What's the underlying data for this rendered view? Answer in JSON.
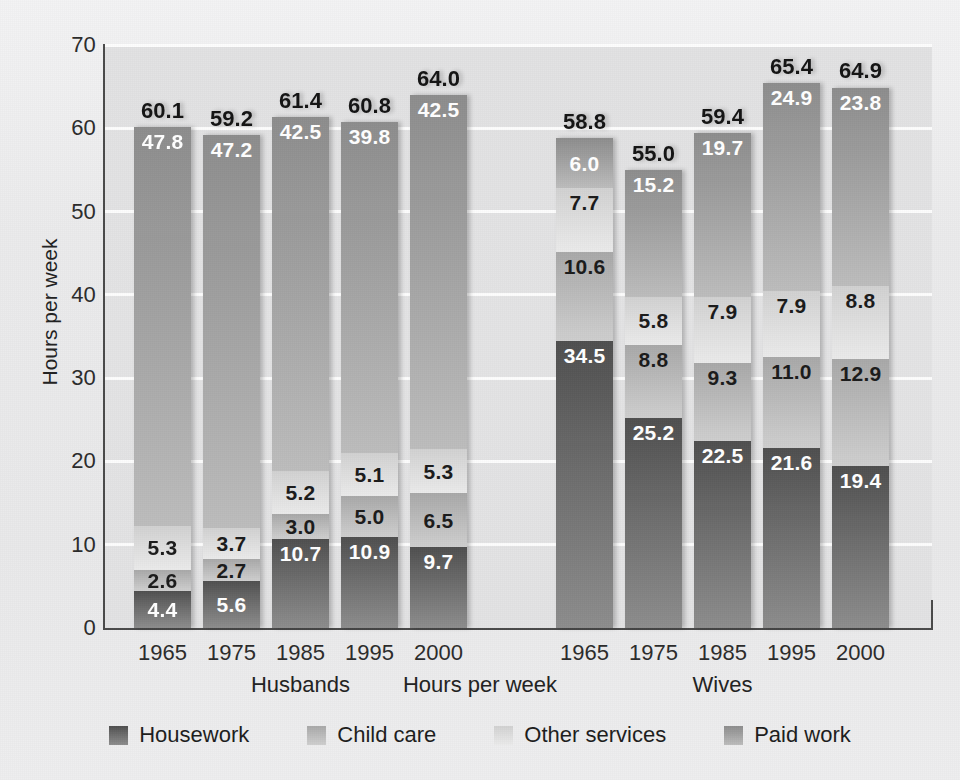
{
  "chart_data": {
    "type": "bar",
    "subtype": "stacked-bar-grouped",
    "title": "",
    "xlabel": "Hours per week",
    "ylabel": "Hours per week",
    "ylim": [
      0,
      70
    ],
    "yticks": [
      0,
      10,
      20,
      30,
      40,
      50,
      60,
      70
    ],
    "ytick_labels": [
      "0",
      "10",
      "20",
      "30",
      "40",
      "50",
      "60",
      "70"
    ],
    "grid": true,
    "legend_position": "bottom",
    "stack_order_bottom_to_top": [
      "Housework",
      "Child care",
      "Other services",
      "Paid work"
    ],
    "categories": [
      "1965",
      "1975",
      "1985",
      "1995",
      "2000"
    ],
    "groups": [
      {
        "name": "Husbands",
        "categories": [
          "1965",
          "1975",
          "1985",
          "1995",
          "2000"
        ],
        "series": [
          {
            "name": "Housework",
            "values": [
              4.4,
              5.6,
              10.7,
              10.9,
              9.7
            ]
          },
          {
            "name": "Child care",
            "values": [
              2.6,
              2.7,
              3.0,
              5.0,
              6.5
            ]
          },
          {
            "name": "Other services",
            "values": [
              5.3,
              3.7,
              5.2,
              5.1,
              5.3
            ]
          },
          {
            "name": "Paid work",
            "values": [
              47.8,
              47.2,
              42.5,
              39.8,
              42.5
            ]
          }
        ],
        "totals": [
          60.1,
          59.2,
          61.4,
          60.8,
          64.0
        ]
      },
      {
        "name": "Wives",
        "categories": [
          "1965",
          "1975",
          "1985",
          "1995",
          "2000"
        ],
        "series": [
          {
            "name": "Housework",
            "values": [
              34.5,
              25.2,
              22.5,
              21.6,
              19.4
            ]
          },
          {
            "name": "Child care",
            "values": [
              10.6,
              8.8,
              9.3,
              11.0,
              12.9
            ]
          },
          {
            "name": "Other services",
            "values": [
              7.7,
              5.8,
              7.9,
              7.9,
              8.8
            ]
          },
          {
            "name": "Paid work",
            "values": [
              6.0,
              15.2,
              19.7,
              24.9,
              23.8
            ]
          }
        ],
        "totals": [
          58.8,
          55.0,
          59.4,
          65.4,
          64.9
        ]
      }
    ],
    "legend": [
      {
        "label": "Housework",
        "color": "#6d6d6d"
      },
      {
        "label": "Child care",
        "color": "#bcbcbc"
      },
      {
        "label": "Other services",
        "color": "#dfdfdf"
      },
      {
        "label": "Paid work",
        "color": "#a2a2a2"
      }
    ],
    "colors": {
      "housework": "#6d6d6d",
      "child_care": "#bcbcbc",
      "other_services": "#dfdfdf",
      "paid_work": "#a2a2a2",
      "plot_background": "#e3e3e4",
      "page_background": "#ebebec",
      "gridline": "#fdfdfd",
      "axis": "#4a4a4a",
      "text": "#1d1d1d"
    }
  }
}
